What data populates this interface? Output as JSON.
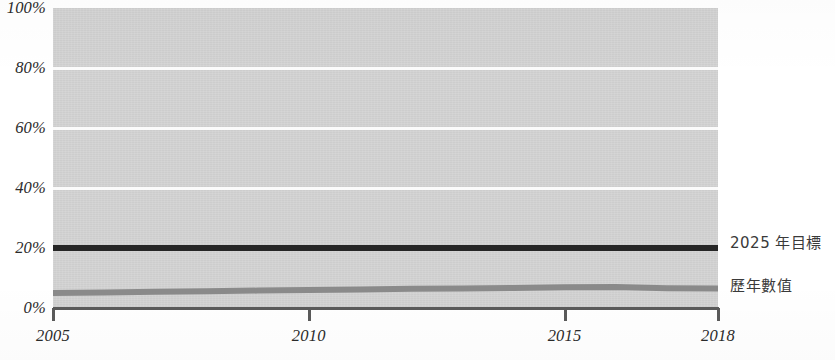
{
  "chart_data": {
    "type": "line",
    "title": "",
    "xlabel": "",
    "ylabel": "",
    "xlim": [
      2005,
      2018
    ],
    "ylim": [
      0,
      100
    ],
    "yticks": [
      "0%",
      "20%",
      "40%",
      "60%",
      "80%",
      "100%"
    ],
    "ytick_values": [
      0,
      20,
      40,
      60,
      80,
      100
    ],
    "xticks": [
      "2005",
      "2010",
      "2015",
      "2018"
    ],
    "xtick_values": [
      2005,
      2010,
      2015,
      2018
    ],
    "grid": true,
    "grid_axis": "y",
    "legend_position": "right-inline",
    "x": [
      2005,
      2006,
      2007,
      2008,
      2009,
      2010,
      2011,
      2012,
      2013,
      2014,
      2015,
      2016,
      2017,
      2018
    ],
    "series": [
      {
        "name": "2025 年目標",
        "color": "#262626",
        "values": [
          20.0,
          20.0,
          20.0,
          20.0,
          20.0,
          20.0,
          20.0,
          20.0,
          20.0,
          20.0,
          20.0,
          20.0,
          20.0,
          20.0
        ]
      },
      {
        "name": "歷年數值",
        "color": "#8a8a8a",
        "values": [
          5.0,
          5.2,
          5.4,
          5.6,
          5.8,
          6.0,
          6.2,
          6.4,
          6.5,
          6.7,
          6.9,
          7.0,
          6.6,
          6.5
        ]
      }
    ],
    "annotations": []
  },
  "axis": {
    "ytick_labels": [
      {
        "text": "100%",
        "value": 100
      },
      {
        "text": "80%",
        "value": 80
      },
      {
        "text": "60%",
        "value": 60
      },
      {
        "text": "40%",
        "value": 40
      },
      {
        "text": "20%",
        "value": 20
      },
      {
        "text": "0%",
        "value": 0
      }
    ],
    "xtick_labels": [
      {
        "text": "2005",
        "value": 2005
      },
      {
        "text": "2010",
        "value": 2010
      },
      {
        "text": "2015",
        "value": 2015
      },
      {
        "text": "2018",
        "value": 2018
      }
    ]
  },
  "legend": {
    "target_label": "2025 年目標",
    "actual_label": "歷年數值"
  },
  "colors": {
    "plot_background": "#d4d4d4",
    "gridline": "#fbfbfb",
    "axis": "#5a5a5a",
    "target_series": "#262626",
    "actual_series": "#8a8a8a",
    "text": "#2b2b2b"
  }
}
